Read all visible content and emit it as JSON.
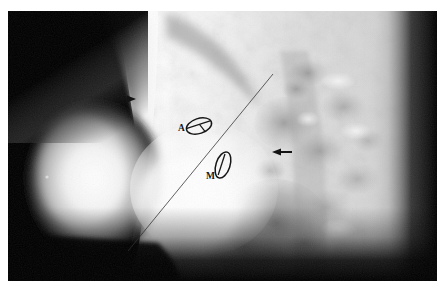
{
  "figure": {
    "kind": "radiograph",
    "modality": "lateral chest radiograph",
    "width": 443,
    "height": 289,
    "paper_color": "#ffffff",
    "plate_background": "#000000"
  },
  "plate": {
    "x": 8,
    "y": 11,
    "width": 429,
    "height": 270
  },
  "annotations": {
    "labels": [
      {
        "id": "aortic-valve-label",
        "text": "A",
        "x": 178,
        "y": 128,
        "font_size": 9,
        "color": "#101010"
      },
      {
        "id": "mitral-valve-label",
        "text": "M",
        "x": 206,
        "y": 176,
        "font_size": 9,
        "color": "#101010"
      }
    ],
    "markers": [
      {
        "id": "aortic-valve-ellipse",
        "label": "A",
        "cx": 199,
        "cy": 126,
        "rx": 13,
        "ry": 7.5,
        "rotation": -18,
        "stroke": "#101010"
      },
      {
        "id": "mitral-valve-ellipse",
        "label": "M",
        "cx": 223,
        "cy": 165,
        "rx": 6.5,
        "ry": 13,
        "rotation": 18,
        "stroke": "#101010"
      }
    ],
    "arrows": [
      {
        "id": "anterior-arrow",
        "direction": "right",
        "tail_x": 116,
        "tail_y": 99,
        "tip_x": 134,
        "tip_y": 99,
        "color": "#0d0d0d"
      },
      {
        "id": "posterior-arrow",
        "direction": "left",
        "tail_x": 292,
        "tail_y": 152,
        "tip_x": 272,
        "tip_y": 152,
        "color": "#0d0d0d"
      }
    ],
    "reference_line": {
      "id": "valve-plane-line",
      "x1": 128,
      "y1": 251,
      "x2": 273,
      "y2": 74,
      "color": "#2b2b2b",
      "width": 0.9
    }
  },
  "legend": {
    "a_means": "A",
    "m_means": "M"
  },
  "colors": {
    "bone_white": "#fbfbfb",
    "soft_tissue": "#d8d8d8",
    "lung_gray": "#bdbdbd",
    "dark_lung": "#8f8f8f",
    "background_black": "#000000",
    "annotation_ink": "#101010"
  }
}
